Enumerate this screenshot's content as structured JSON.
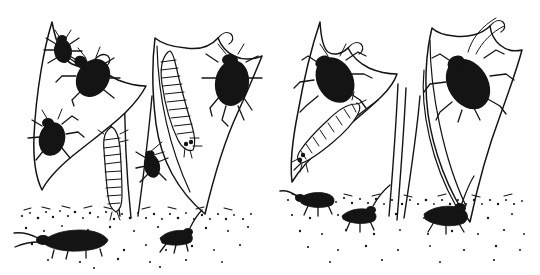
{
  "image": {
    "title": "Insect life stages on plant foliage",
    "medium": "pen-and-ink line drawing",
    "background_color": "#ffffff",
    "ink_color": "#141414",
    "width": 540,
    "height": 275,
    "panel_count": 2,
    "caption": ""
  },
  "panels": [
    {
      "id": "left-group",
      "label": "Left plant group",
      "leaves": [
        {
          "id": "left-leaf-a",
          "label": "Left outer leaf",
          "tip_x": 52,
          "tip_y": 22,
          "base_x": 75,
          "base_y": 175,
          "occupants": [
            "adult-beetle-small-top",
            "adult-beetle-large-upper",
            "adult-beetle-lower"
          ]
        },
        {
          "id": "left-leaf-b",
          "label": "Left inner leaf",
          "tip_x": 155,
          "tip_y": 38,
          "base_x": 205,
          "base_y": 214,
          "occupants": [
            "larva-on-leaf-b",
            "adult-beetle-leaf-b"
          ]
        }
      ],
      "stems": [
        {
          "id": "left-stem-1",
          "top_x": 113,
          "bottom_x": 122
        },
        {
          "id": "left-stem-2",
          "top_x": 128,
          "bottom_x": 131
        },
        {
          "id": "left-stem-3",
          "top_x": 150,
          "bottom_x": 139
        }
      ],
      "insects": [
        {
          "id": "adult-beetle-small-top",
          "type": "adult-beetle",
          "silhouette": "solid-black",
          "size": "small",
          "x": 62,
          "y": 50,
          "rotation": -15,
          "legs": 6,
          "antennae": 2
        },
        {
          "id": "adult-beetle-large-upper",
          "type": "adult-beetle",
          "silhouette": "solid-black",
          "size": "large",
          "x": 92,
          "y": 76,
          "rotation": 35,
          "legs": 6,
          "antennae": 2
        },
        {
          "id": "adult-beetle-lower",
          "type": "adult-beetle",
          "silhouette": "solid-black",
          "size": "medium",
          "x": 52,
          "y": 138,
          "rotation": 20,
          "legs": 6,
          "antennae": 2
        },
        {
          "id": "larva-on-stem",
          "type": "larva",
          "silhouette": "outlined-segmented",
          "size": "medium",
          "x": 113,
          "y": 160,
          "segments": 11
        },
        {
          "id": "larva-on-leaf-b",
          "type": "larva",
          "silhouette": "outlined-segmented",
          "size": "large",
          "x": 181,
          "y": 100,
          "segments": 12
        },
        {
          "id": "adult-beetle-leaf-b",
          "type": "adult-beetle",
          "silhouette": "solid-black",
          "size": "large",
          "x": 232,
          "y": 82,
          "rotation": 10,
          "legs": 6,
          "antennae": 2
        },
        {
          "id": "adult-beetle-on-stem",
          "type": "adult-beetle",
          "silhouette": "solid-black",
          "size": "small",
          "x": 152,
          "y": 163,
          "rotation": 0,
          "legs": 6,
          "antennae": 2
        },
        {
          "id": "ground-beetle-left",
          "type": "ground-beetle",
          "silhouette": "solid-black",
          "size": "large",
          "x": 68,
          "y": 239,
          "antennae": 2
        },
        {
          "id": "ground-beetle-left-2",
          "type": "ground-beetle",
          "silhouette": "solid-black",
          "size": "small",
          "x": 175,
          "y": 239,
          "antennae": 2
        }
      ]
    },
    {
      "id": "right-group",
      "label": "Right plant group",
      "leaves": [
        {
          "id": "right-leaf-a",
          "label": "Right outer leaf",
          "tip_x": 320,
          "tip_y": 22,
          "base_x": 297,
          "base_y": 180,
          "occupants": [
            "adult-beetle-right-a",
            "larva-right-a"
          ]
        },
        {
          "id": "right-leaf-b",
          "label": "Right inner leaf",
          "tip_x": 432,
          "tip_y": 28,
          "base_x": 470,
          "base_y": 222,
          "occupants": [
            "adult-beetle-right-b"
          ]
        }
      ],
      "stems": [
        {
          "id": "right-stem-1",
          "top_x": 396,
          "bottom_x": 388
        },
        {
          "id": "right-stem-2",
          "top_x": 404,
          "bottom_x": 398
        },
        {
          "id": "right-stem-3",
          "top_x": 418,
          "bottom_x": 404
        }
      ],
      "insects": [
        {
          "id": "adult-beetle-right-a",
          "type": "adult-beetle",
          "silhouette": "solid-black",
          "size": "large",
          "x": 333,
          "y": 78,
          "rotation": -25,
          "legs": 6,
          "antennae": 2
        },
        {
          "id": "larva-right-a",
          "type": "larva",
          "silhouette": "outlined-segmented",
          "size": "large",
          "x": 325,
          "y": 128,
          "segments": 11
        },
        {
          "id": "adult-beetle-right-b",
          "type": "adult-beetle",
          "silhouette": "solid-black",
          "size": "extra-large",
          "x": 468,
          "y": 80,
          "rotation": -35,
          "legs": 6,
          "antennae": 2
        },
        {
          "id": "ground-beetle-right-1",
          "type": "ground-beetle",
          "silhouette": "solid-black",
          "size": "small",
          "x": 315,
          "y": 205,
          "antennae": 2
        },
        {
          "id": "ground-beetle-right-2",
          "type": "ground-beetle",
          "silhouette": "solid-black",
          "size": "small",
          "x": 357,
          "y": 220,
          "antennae": 2
        },
        {
          "id": "ground-beetle-right-3",
          "type": "ground-beetle",
          "silhouette": "solid-black",
          "size": "medium",
          "x": 442,
          "y": 216,
          "antennae": 2
        }
      ]
    }
  ],
  "ground": {
    "id": "soil-line",
    "label": "Stippled soil surface",
    "style": "stippled-dots",
    "left_band_y": 212,
    "right_band_y": 198,
    "dot_color": "#141414"
  }
}
